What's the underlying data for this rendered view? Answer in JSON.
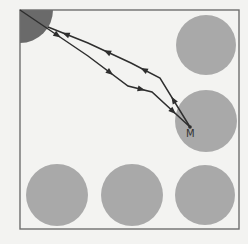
{
  "diagram": {
    "colors": {
      "background": "#f3f3f1",
      "box_border": "#6e6e6e",
      "circle_fill": "#a9a9a9",
      "corner_fill": "#6a6a6a",
      "path_stroke": "#2e2e2e"
    },
    "box": {
      "x": 20,
      "y": 10,
      "width": 219,
      "height": 219
    },
    "corner_region": {
      "cx": 20,
      "cy": 10,
      "r": 33
    },
    "circles": [
      {
        "id": "top-right",
        "cx": 206,
        "cy": 45,
        "r": 30
      },
      {
        "id": "middle-right",
        "cx": 206,
        "cy": 121,
        "r": 31
      },
      {
        "id": "bottom-left",
        "cx": 57,
        "cy": 195,
        "r": 31
      },
      {
        "id": "bottom-middle",
        "cx": 132,
        "cy": 195,
        "r": 31
      },
      {
        "id": "bottom-right",
        "cx": 205,
        "cy": 195,
        "r": 30
      }
    ],
    "point_m": {
      "label": "M",
      "x": 190,
      "y": 127,
      "label_x": 186,
      "label_y": 129
    },
    "paths": {
      "outgoing": [
        [
          20,
          10
        ],
        [
          88,
          56
        ],
        [
          128,
          86
        ],
        [
          152,
          92
        ],
        [
          190,
          127
        ]
      ],
      "returning": [
        [
          190,
          127
        ],
        [
          160,
          78
        ],
        [
          131,
          63
        ],
        [
          88,
          43
        ],
        [
          48,
          27
        ]
      ]
    }
  }
}
